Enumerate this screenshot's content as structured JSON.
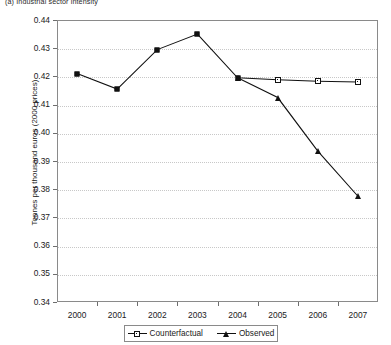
{
  "caption": "(a) Industrial sector intensity",
  "chart_data": {
    "type": "line",
    "title": "(a) Industrial sector intensity",
    "xlabel": "",
    "ylabel": "Tonnes per thousand euros (2000 prices)",
    "categories": [
      "2000",
      "2001",
      "2002",
      "2003",
      "2004",
      "2005",
      "2006",
      "2007"
    ],
    "x": [
      2000,
      2001,
      2002,
      2003,
      2004,
      2005,
      2006,
      2007
    ],
    "ylim": [
      0.34,
      0.44
    ],
    "ytick_labels": [
      "0.44",
      "0.43",
      "0.42",
      "0.41",
      "0.40",
      "0.39",
      "0.38",
      "0.37",
      "0.36",
      "0.35",
      "0.34"
    ],
    "ytick_values": [
      0.44,
      0.43,
      0.42,
      0.41,
      0.4,
      0.39,
      0.38,
      0.37,
      0.36,
      0.35,
      0.34
    ],
    "ytick_step": 0.01,
    "grid": true,
    "grid_axis": "y",
    "legend_position": "bottom",
    "series": [
      {
        "name": "Counterfactual",
        "marker": "square",
        "color": "#111111",
        "values": [
          0.421,
          0.4155,
          0.4295,
          0.435,
          0.4195,
          0.4188,
          0.4183,
          0.418
        ]
      },
      {
        "name": "Observed",
        "marker": "triangle",
        "color": "#111111",
        "values": [
          null,
          null,
          null,
          null,
          0.4195,
          0.4125,
          0.3935,
          0.3775
        ]
      }
    ]
  },
  "legend": {
    "items": [
      {
        "label": "Counterfactual",
        "marker": "open-square-marker"
      },
      {
        "label": "Observed",
        "marker": "filled-triangle-marker"
      }
    ]
  }
}
